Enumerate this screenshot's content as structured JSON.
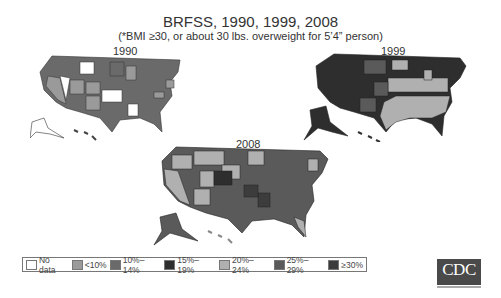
{
  "header": {
    "title": "BRFSS, 1990, 1999, 2008",
    "subtitle": "(*BMI ≥30, or about 30 lbs. overweight for 5’4” person)"
  },
  "maps": [
    {
      "year": "1990"
    },
    {
      "year": "1999"
    },
    {
      "year": "2008"
    }
  ],
  "legend": {
    "items": [
      {
        "label": "No data",
        "color": "#ffffff"
      },
      {
        "label": "<10%",
        "color": "#9a9a9a"
      },
      {
        "label": "10%–14%",
        "color": "#6a6a6a"
      },
      {
        "label": "15%–19%",
        "color": "#2e2e2e"
      },
      {
        "label": "20%–24%",
        "color": "#b0b0b0"
      },
      {
        "label": "25%–29%",
        "color": "#5a5a5a"
      },
      {
        "label": "≥30%",
        "color": "#3c3c3c"
      }
    ]
  },
  "logo": {
    "text": "CDC"
  }
}
